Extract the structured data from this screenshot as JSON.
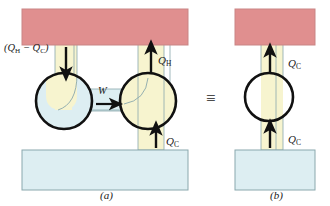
{
  "figure": {
    "colors": {
      "hot_reservoir": "#e08f8f",
      "cold_reservoir": "#ddeef2",
      "working_channel": "#f7f4cf",
      "outline": "#8aa8ad",
      "stroke": "#111111",
      "background": "#ffffff"
    }
  },
  "panel_a": {
    "caption": "(a)",
    "hot_reservoir_label": "",
    "cold_reservoir_label": "",
    "labels": {
      "net_work_input": "(Q",
      "net_work_input_sub1": "H",
      "net_work_input_mid": " − Q",
      "net_work_input_sub2": "C",
      "net_work_input_end": ")",
      "work": "W",
      "heat_hot": "Q",
      "heat_hot_sub": "H",
      "heat_cold": "Q",
      "heat_cold_sub": "C"
    },
    "arrows": {
      "left_channel_direction": "down",
      "right_top_direction": "up",
      "right_bottom_direction": "up",
      "work_direction": "right"
    }
  },
  "equivalence": {
    "symbol": "≡"
  },
  "panel_b": {
    "caption": "(b)",
    "labels": {
      "heat_cold_top": "Q",
      "heat_cold_top_sub": "C",
      "heat_cold_bottom": "Q",
      "heat_cold_bottom_sub": "C"
    },
    "arrows": {
      "top_direction": "up",
      "bottom_direction": "up"
    }
  }
}
